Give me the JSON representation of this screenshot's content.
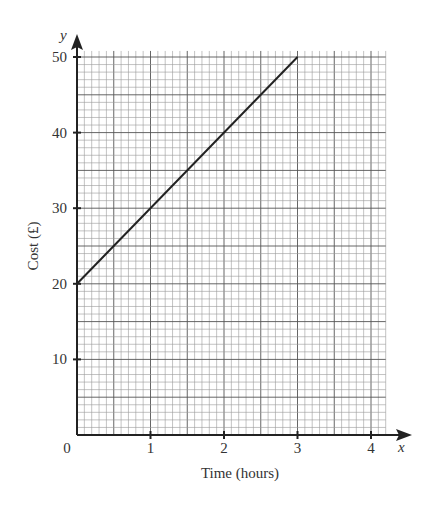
{
  "chart_data": {
    "type": "line",
    "title": "",
    "xlabel": "Time (hours)",
    "ylabel": "Cost (£)",
    "x_axis_var": "x",
    "y_axis_var": "y",
    "x_ticks": [
      0,
      1,
      2,
      3,
      4
    ],
    "y_ticks": [
      10,
      20,
      30,
      40,
      50
    ],
    "origin_label": "0",
    "xlim": [
      0,
      4.2
    ],
    "ylim": [
      0,
      51
    ],
    "grid": true,
    "grid_minor_x_step": 0.1,
    "grid_minor_y_step": 1,
    "grid_major_x_step": 0.5,
    "grid_major_y_step": 5,
    "series": [
      {
        "name": "Cost",
        "x": [
          0,
          3
        ],
        "y": [
          20,
          50
        ],
        "color": "#222222"
      }
    ]
  },
  "colors": {
    "axis": "#222222",
    "grid_minor": "#9a9a9a",
    "grid_major": "#555555",
    "line": "#222222",
    "text": "#333333"
  }
}
